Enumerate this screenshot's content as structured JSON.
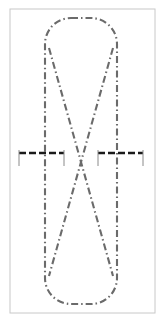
{
  "image": {
    "width": 163,
    "height": 331,
    "background_color": "#ffffff",
    "title": "Dash-dot centerline schematic with crossed loop and dimension markers"
  },
  "frame": {
    "label": "drawing-border",
    "x": 10,
    "y": 9,
    "width": 145,
    "height": 304,
    "stroke_color": "#c8c8c8",
    "stroke_width": 1,
    "fill": "none"
  },
  "colors": {
    "centerline": "#6b6b6b",
    "marker": "#1a1a1a",
    "marker_tick": "#8a8a8a",
    "frame": "#c8c8c8",
    "background": "#ffffff"
  },
  "line_styles": {
    "centerline_dasharray": "7,3,1.5,3",
    "centerline_width": 2.1,
    "marker_dasharray": "7,3",
    "marker_width": 2.6,
    "tick_width": 1
  },
  "shapes": {
    "loop": {
      "name": "rounded-loop-outline",
      "description": "closed stadium / rounded-rectangle loop spanning full height",
      "left_x": 45,
      "right_x": 117,
      "top_y": 18,
      "bottom_y": 304,
      "corner_radius": 26,
      "style": "dash-dot"
    },
    "diagonals": [
      {
        "name": "diagonal-left-to-right",
        "description": "runs from upper-left of loop down to lower-right of loop",
        "x1": 49,
        "y1": 48,
        "x2": 113,
        "y2": 276,
        "style": "dash-dot"
      },
      {
        "name": "diagonal-right-to-left",
        "description": "runs from upper-right of loop down to lower-left of loop",
        "x1": 113,
        "y1": 48,
        "x2": 49,
        "y2": 276,
        "style": "dash-dot"
      }
    ],
    "crossing_point": {
      "name": "x-crossing",
      "x": 81,
      "y": 162
    }
  },
  "markers": [
    {
      "name": "dimension-marker-left",
      "bar_y": 153,
      "x_start": 19,
      "x_end": 64,
      "tick_y_top": 150,
      "tick_y_bottom": 166,
      "tick_positions": [
        19,
        64
      ],
      "style": "dashed",
      "color": "#1a1a1a"
    },
    {
      "name": "dimension-marker-right",
      "bar_y": 153,
      "x_start": 98,
      "x_end": 143,
      "tick_y_top": 150,
      "tick_y_bottom": 166,
      "tick_positions": [
        98,
        143
      ],
      "style": "dashed",
      "color": "#1a1a1a"
    }
  ],
  "labels": {
    "figure_caption": "",
    "annotations": []
  }
}
